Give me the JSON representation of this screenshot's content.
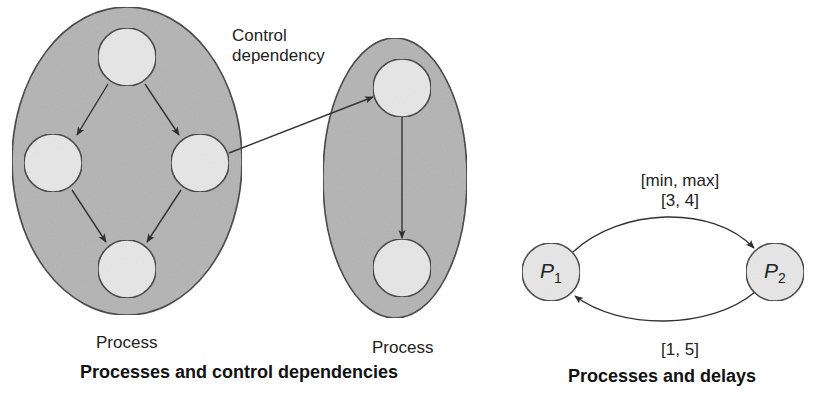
{
  "colors": {
    "process_fill": "#b4b4b4",
    "node_fill": "#e6e6e6",
    "stroke": "#3a3a3a",
    "text": "#222222"
  },
  "left_panel": {
    "title": "Processes and control dependencies",
    "processes": [
      {
        "label": "Process",
        "nodes": [
          "top",
          "left",
          "right",
          "bottom"
        ],
        "edges": [
          [
            "top",
            "left"
          ],
          [
            "top",
            "right"
          ],
          [
            "left",
            "bottom"
          ],
          [
            "right",
            "bottom"
          ]
        ]
      },
      {
        "label": "Process",
        "nodes": [
          "top",
          "bottom"
        ],
        "edges": [
          [
            "top",
            "bottom"
          ]
        ]
      }
    ],
    "control_dependency": {
      "label_line1": "Control",
      "label_line2": "dependency",
      "from": "process1.right",
      "to": "process2.top"
    }
  },
  "right_panel": {
    "title": "Processes and delays",
    "nodes": [
      {
        "id": "P1",
        "name": "P",
        "subscript": "1"
      },
      {
        "id": "P2",
        "name": "P",
        "subscript": "2"
      }
    ],
    "edges": [
      {
        "from": "P1",
        "to": "P2",
        "header": "[min, max]",
        "label": "[3, 4]"
      },
      {
        "from": "P2",
        "to": "P1",
        "label": "[1, 5]"
      }
    ]
  }
}
